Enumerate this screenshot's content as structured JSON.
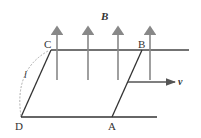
{
  "diagram": {
    "field_label": "B",
    "velocity_label": "v",
    "length_label": "l",
    "points": {
      "A": "A",
      "B": "B",
      "C": "C",
      "D": "D"
    },
    "colors": {
      "rail": "#333333",
      "field_arrow": "#888888",
      "dashed": "#999999"
    }
  }
}
